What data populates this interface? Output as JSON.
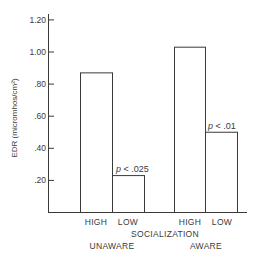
{
  "chart_data": {
    "type": "bar",
    "title": "",
    "xlabel": "SOCIALIZATION",
    "ylabel": "EDR (micromhos/cm²)",
    "ylim": [
      0,
      1.2
    ],
    "yticks": [
      ".20",
      ".40",
      ".60",
      ".80",
      "1.00",
      "1.20"
    ],
    "ytick_values": [
      0.2,
      0.4,
      0.6,
      0.8,
      1.0,
      1.2
    ],
    "grid": false,
    "groups": [
      "UNAWARE",
      "AWARE"
    ],
    "categories": [
      "HIGH",
      "LOW"
    ],
    "series": [
      {
        "name": "UNAWARE",
        "categories": [
          "HIGH",
          "LOW"
        ],
        "values": [
          0.87,
          0.23
        ]
      },
      {
        "name": "AWARE",
        "categories": [
          "HIGH",
          "LOW"
        ],
        "values": [
          1.03,
          0.5
        ]
      }
    ],
    "annotations": [
      {
        "group": "UNAWARE",
        "bar": "LOW",
        "text_p": "p",
        "text_rest": " < .025"
      },
      {
        "group": "AWARE",
        "bar": "LOW",
        "text_p": "p",
        "text_rest": " < .01"
      }
    ]
  },
  "colors": {
    "ink": "#3a3a3a",
    "bar_fill": "#ffffff",
    "background": "#ffffff"
  }
}
